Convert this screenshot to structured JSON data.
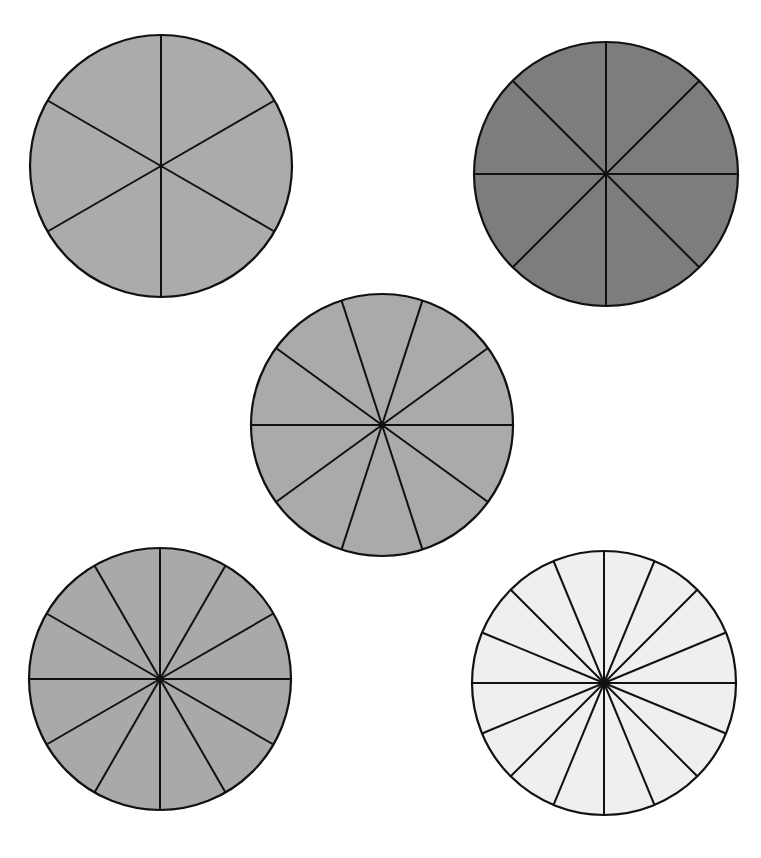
{
  "diagram": {
    "type": "fraction-circles",
    "stroke": "#111111",
    "circles": [
      {
        "name": "circle-sixths",
        "slices": 6,
        "cx": 161,
        "cy": 166,
        "r": 131,
        "fill": "#ababab",
        "start_angle": 90
      },
      {
        "name": "circle-eighths",
        "slices": 8,
        "cx": 606,
        "cy": 174,
        "r": 132,
        "fill": "#7d7d7d",
        "start_angle": 90
      },
      {
        "name": "circle-tenths",
        "slices": 10,
        "cx": 382,
        "cy": 425,
        "r": 131,
        "fill": "#aaaaaa",
        "start_angle": 0
      },
      {
        "name": "circle-twelfths",
        "slices": 12,
        "cx": 160,
        "cy": 679,
        "r": 131,
        "fill": "#a9a9a9",
        "start_angle": 90
      },
      {
        "name": "circle-sixteenths",
        "slices": 16,
        "cx": 604,
        "cy": 683,
        "r": 132,
        "fill": "#efefef",
        "start_angle": 90
      }
    ]
  }
}
